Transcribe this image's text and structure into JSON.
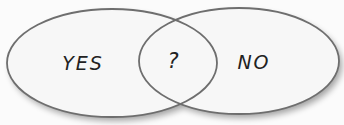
{
  "diagram": {
    "type": "venn",
    "sets": [
      {
        "id": "left",
        "label": "YES"
      },
      {
        "id": "right",
        "label": "NO"
      }
    ],
    "intersection": {
      "label": "?"
    }
  },
  "colors": {
    "fill": "#f7f7f7",
    "stroke": "#6e6e6e",
    "text": "#222222"
  }
}
